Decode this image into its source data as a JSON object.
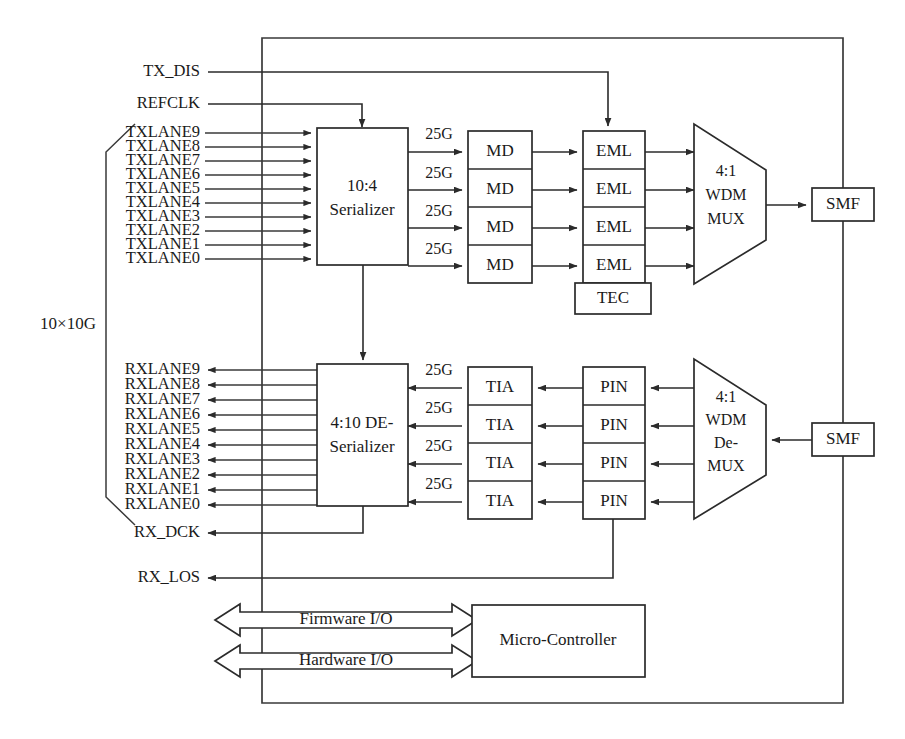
{
  "diagram": {
    "group_label": "10×10G",
    "control_signals": [
      {
        "name": "TX_DIS"
      },
      {
        "name": "REFCLK"
      },
      {
        "name": "RX_DCK"
      },
      {
        "name": "RX_LOS"
      }
    ],
    "tx_lanes": [
      "TXLANE9",
      "TXLANE8",
      "TXLANE7",
      "TXLANE6",
      "TXLANE5",
      "TXLANE4",
      "TXLANE3",
      "TXLANE2",
      "TXLANE1",
      "TXLANE0"
    ],
    "rx_lanes": [
      "RXLANE9",
      "RXLANE8",
      "RXLANE7",
      "RXLANE6",
      "RXLANE5",
      "RXLANE4",
      "RXLANE3",
      "RXLANE2",
      "RXLANE1",
      "RXLANE0"
    ],
    "serializer": {
      "line1": "10:4",
      "line2": "Serializer"
    },
    "deserializer": {
      "line1": "4:10 DE-",
      "line2": "Serializer"
    },
    "tx_rate_labels": [
      "25G",
      "25G",
      "25G",
      "25G"
    ],
    "rx_rate_labels": [
      "25G",
      "25G",
      "25G",
      "25G"
    ],
    "md_blocks": [
      "MD",
      "MD",
      "MD",
      "MD"
    ],
    "eml_blocks": [
      "EML",
      "EML",
      "EML",
      "EML"
    ],
    "tec_block": "TEC",
    "tia_blocks": [
      "TIA",
      "TIA",
      "TIA",
      "TIA"
    ],
    "pin_blocks": [
      "PIN",
      "PIN",
      "PIN",
      "PIN"
    ],
    "mux": {
      "line1": "4:1",
      "line2": "WDM",
      "line3": "MUX"
    },
    "demux": {
      "line1": "4:1",
      "line2": "WDM",
      "line3": "De-",
      "line4": "MUX"
    },
    "smf_tx": "SMF",
    "smf_rx": "SMF",
    "firmware_io": "Firmware I/O",
    "hardware_io": "Hardware I/O",
    "microcontroller": "Micro-Controller",
    "colors": {
      "line": "#2b2b2b",
      "frame": "#3a3a3a",
      "text": "#1a1a1a",
      "background": "#ffffff"
    }
  }
}
